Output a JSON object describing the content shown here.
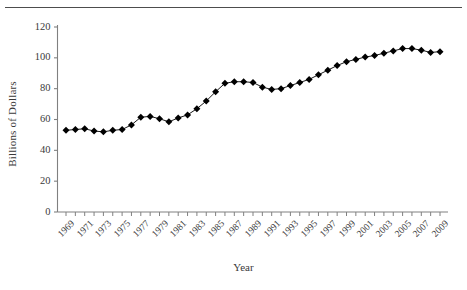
{
  "figure": {
    "rule_name": "top-horizontal-rule"
  },
  "chart_data": {
    "type": "line",
    "title": "",
    "subtitle": "",
    "xlabel": "Year",
    "ylabel": "Billions of Dollars",
    "xlim": [
      1968.4,
      2009.8
    ],
    "ylim": [
      0,
      120
    ],
    "grid": false,
    "legend": null,
    "marker": "filled-diamond",
    "line_color": "#000000",
    "marker_color": "#000000",
    "axis_color": "#808080",
    "ytick_labels": [
      "0",
      "20",
      "40",
      "60",
      "80",
      "100",
      "120"
    ],
    "yticks": [
      0,
      20,
      40,
      60,
      80,
      100,
      120
    ],
    "xtick_labels": [
      "1969",
      "1971",
      "1973",
      "1975",
      "1977",
      "1979",
      "1981",
      "1983",
      "1985",
      "1987",
      "1989",
      "1991",
      "1993",
      "1995",
      "1997",
      "1999",
      "2001",
      "2003",
      "2005",
      "2007",
      "2009"
    ],
    "xticks_minor_every": 1,
    "x": [
      1969,
      1970,
      1971,
      1972,
      1973,
      1974,
      1975,
      1976,
      1977,
      1978,
      1979,
      1980,
      1981,
      1982,
      1983,
      1984,
      1985,
      1986,
      1987,
      1988,
      1989,
      1990,
      1991,
      1992,
      1993,
      1994,
      1995,
      1996,
      1997,
      1998,
      1999,
      2000,
      2001,
      2002,
      2003,
      2004,
      2005,
      2006,
      2007,
      2008,
      2009
    ],
    "values": [
      53,
      53.5,
      54,
      52.5,
      52,
      53,
      53.5,
      56.5,
      61.5,
      62,
      60.5,
      58.5,
      61,
      63,
      67,
      72,
      78,
      83.5,
      84.5,
      84.5,
      84,
      81,
      79.5,
      80,
      82,
      84,
      86,
      89,
      92,
      95,
      97.5,
      99,
      100.5,
      101.5,
      103,
      104.5,
      106,
      106,
      105,
      103.5,
      104
    ],
    "categories": null,
    "series": [
      {
        "name": "Billions of Dollars",
        "values": [
          53,
          53.5,
          54,
          52.5,
          52,
          53,
          53.5,
          56.5,
          61.5,
          62,
          60.5,
          58.5,
          61,
          63,
          67,
          72,
          78,
          83.5,
          84.5,
          84.5,
          84,
          81,
          79.5,
          80,
          82,
          84,
          86,
          89,
          92,
          95,
          97.5,
          99,
          100.5,
          101.5,
          103,
          104.5,
          106,
          106,
          105,
          103.5,
          104
        ]
      }
    ]
  }
}
